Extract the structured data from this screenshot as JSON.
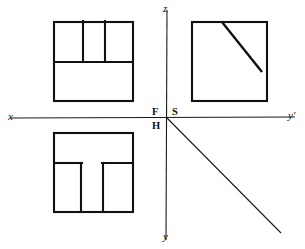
{
  "figure": {
    "canvas": {
      "width": 305,
      "height": 249,
      "background": "#ffffff"
    },
    "stroke_color": "#111111",
    "axis_color": "#1a1a1a"
  },
  "axes": {
    "origin": {
      "x": 167,
      "y": 118
    },
    "horizontal": {
      "name": "x-y-prime-axis",
      "x1": 10,
      "y1": 118,
      "x2": 295,
      "y2": 117,
      "left_label": "x",
      "right_label": "y′"
    },
    "vertical": {
      "name": "z-y-axis",
      "x1": 167,
      "y1": 10,
      "x2": 166,
      "y2": 240,
      "top_label": "z",
      "bottom_label": "y"
    },
    "oblique": {
      "name": "oblique-axis",
      "x1": 167,
      "y1": 118,
      "x2": 281,
      "y2": 233
    }
  },
  "plane_labels": [
    {
      "id": "F",
      "text": "F",
      "meaning": "frontal-plane"
    },
    {
      "id": "S",
      "text": "S",
      "meaning": "side-profile-plane"
    },
    {
      "id": "H",
      "text": "H",
      "meaning": "horizontal-plane"
    }
  ],
  "views": {
    "front": {
      "name": "front-view",
      "label": "F",
      "rect": {
        "x": 54,
        "y": 22,
        "w": 79,
        "h": 79
      },
      "inner_lines": [
        {
          "x1": 83,
          "y1": 22,
          "x2": 83,
          "y2": 62
        },
        {
          "x1": 105,
          "y1": 22,
          "x2": 105,
          "y2": 62
        },
        {
          "x1": 54,
          "y1": 62,
          "x2": 133,
          "y2": 62
        }
      ]
    },
    "side": {
      "name": "side-view",
      "label": "S",
      "rect": {
        "x": 192,
        "y": 22,
        "w": 75,
        "h": 79
      },
      "diagonal": {
        "x1": 222,
        "y1": 22,
        "x2": 262,
        "y2": 72
      }
    },
    "top": {
      "name": "top-view",
      "label": "H",
      "rect": {
        "x": 54,
        "y": 133,
        "w": 79,
        "h": 79
      },
      "inner_lines": [
        {
          "x1": 54,
          "y1": 163,
          "x2": 81,
          "y2": 163
        },
        {
          "x1": 103,
          "y1": 163,
          "x2": 133,
          "y2": 163
        },
        {
          "x1": 81,
          "y1": 163,
          "x2": 81,
          "y2": 212
        },
        {
          "x1": 103,
          "y1": 163,
          "x2": 103,
          "y2": 212
        }
      ]
    }
  }
}
